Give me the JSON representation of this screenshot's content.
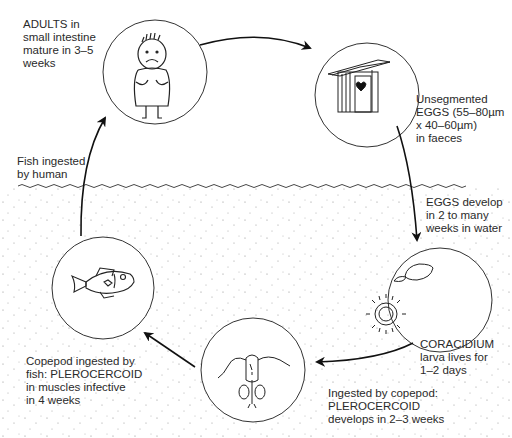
{
  "stages": [
    {
      "id": "adults",
      "icon": "sick-human-icon",
      "lines": [
        "ADULTS in",
        "small intestine",
        "mature in 3–5",
        "weeks"
      ]
    },
    {
      "id": "eggs",
      "icon": "outhouse-icon",
      "lines": [
        "Unsegmented",
        "EGGS (55–80µm",
        "x 40–60µm)",
        "in faeces"
      ]
    },
    {
      "id": "coracidium",
      "icon": "coracidium-egg-icon",
      "lines": [
        "CORACIDIUM",
        "larva lives for",
        "1–2 days"
      ]
    },
    {
      "id": "copepod",
      "icon": "copepod-icon",
      "lines": [
        "Ingested by copepod:",
        "PLEROCERCOID",
        "develops in 2–3 weeks"
      ]
    },
    {
      "id": "fish",
      "icon": "fish-icon",
      "lines": [
        "Copepod ingested by",
        "fish: PLEROCERCOID",
        "in muscles infective",
        "in 4 weeks"
      ]
    }
  ],
  "transitions": [
    {
      "id": "eggs-develop",
      "lines": [
        "EGGS develop",
        "in 2 to many",
        "weeks in water"
      ]
    },
    {
      "id": "fish-ingested",
      "lines": [
        "Fish ingested",
        "by human"
      ]
    }
  ],
  "colors": {
    "ink": "#1a1a1a",
    "text": "#2a2a2a",
    "background": "#ffffff"
  }
}
